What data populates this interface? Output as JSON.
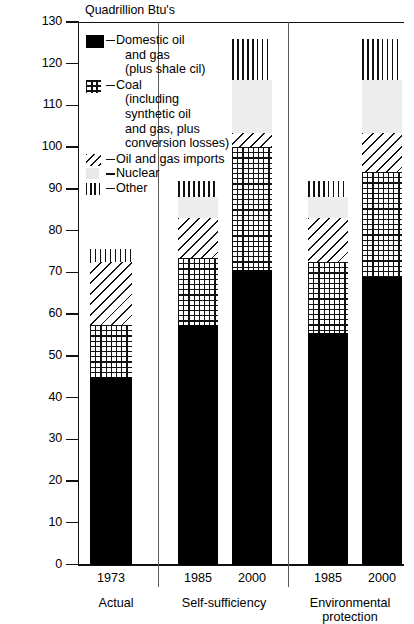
{
  "chart_data": {
    "type": "bar",
    "stacked": true,
    "title": "Quadrillion Btu's",
    "xlabel": "",
    "ylabel": "Quadrillion Btu's",
    "ylim": [
      0,
      130
    ],
    "ytick_step": 10,
    "yticks": [
      0,
      10,
      20,
      30,
      40,
      50,
      60,
      70,
      80,
      90,
      100,
      110,
      120,
      130
    ],
    "grid": false,
    "legend_position": "inside-top-left",
    "categories": [
      "1973",
      "1985",
      "2000",
      "1985",
      "2000"
    ],
    "groups": [
      {
        "name": "Actual",
        "categories": [
          "1973"
        ]
      },
      {
        "name": "Self-sufficiency",
        "categories": [
          "1985",
          "2000"
        ]
      },
      {
        "name": "Environmental protection",
        "categories": [
          "1985",
          "2000"
        ]
      }
    ],
    "series": [
      {
        "name": "Domestic oil and gas (plus shale oil)",
        "key": "domestic",
        "values": [
          45,
          57.5,
          70.5,
          55.5,
          69
        ]
      },
      {
        "name": "Coal (including synthetic oil and gas, plus conversion losses)",
        "key": "coal",
        "values": [
          12.5,
          16,
          29.5,
          17,
          25
        ]
      },
      {
        "name": "Oil and gas imports",
        "key": "imports",
        "values": [
          15,
          9.5,
          3.5,
          10.5,
          9.5
        ]
      },
      {
        "name": "Nuclear",
        "key": "nuclear",
        "values": [
          0,
          5,
          12.5,
          5,
          12.5
        ]
      },
      {
        "name": "Other",
        "key": "other",
        "values": [
          3,
          4,
          10,
          4,
          10
        ]
      }
    ],
    "totals": [
      75.5,
      92,
      126,
      92,
      126
    ],
    "annotations": []
  },
  "legend": {
    "items": [
      {
        "swatch": "domestic",
        "lines": [
          "Domestic oil",
          "and gas",
          "(plus shale cil)"
        ]
      },
      {
        "swatch": "coal",
        "lines": [
          "Coal",
          "(including",
          "synthetic oil",
          "and gas, plus",
          "conversion losses)"
        ]
      },
      {
        "swatch": "imports",
        "lines": [
          "Oil and gas imports"
        ]
      },
      {
        "swatch": "nuclear",
        "lines": [
          "Nuclear"
        ]
      },
      {
        "swatch": "other",
        "lines": [
          "Other"
        ]
      }
    ]
  },
  "axis": {
    "y_labels": [
      "130",
      "120",
      "110",
      "100",
      "90",
      "80",
      "70",
      "60",
      "50",
      "40",
      "30",
      "20",
      "10",
      "0"
    ],
    "x_labels": [
      "1973",
      "1985",
      "2000",
      "1985",
      "2000"
    ],
    "group_labels": [
      "Actual",
      "Self-sufficiency",
      "Environmental protection"
    ]
  }
}
